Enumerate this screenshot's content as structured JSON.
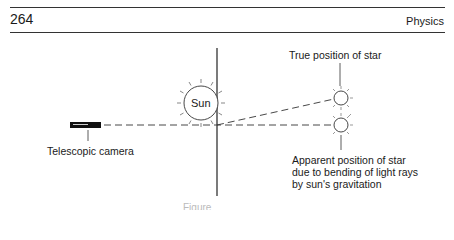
{
  "header": {
    "page_number": "264",
    "running_head": "Physics"
  },
  "diagram": {
    "camera_label": "Telescopic camera",
    "sun_label": "Sun",
    "true_star_label": "True position of star",
    "apparent_star_label_lines": [
      "Apparent position of star",
      "due to bending of light rays",
      "by sun's gravitation"
    ],
    "line_color": "#333333"
  },
  "caption": {
    "text": "Figure"
  }
}
